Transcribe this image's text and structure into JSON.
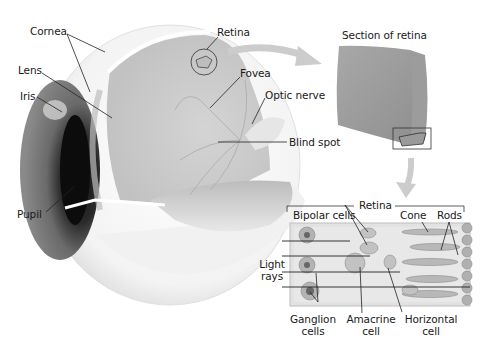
{
  "eye": {
    "labels": {
      "cornea": "Cornea",
      "lens": "Lens",
      "iris": "Iris",
      "pupil": "Pupil",
      "retina": "Retina",
      "fovea": "Fovea",
      "optic_nerve": "Optic nerve",
      "blind_spot": "Blind spot"
    }
  },
  "section": {
    "title": "Section of retina"
  },
  "retina_detail": {
    "title": "Retina",
    "labels": {
      "bipolar": "Bipolar cells",
      "cone": "Cone",
      "rods": "Rods",
      "light_1": "Light",
      "light_2": "rays",
      "ganglion_1": "Ganglion",
      "ganglion_2": "cells",
      "amacrine_1": "Amacrine",
      "amacrine_2": "cell",
      "horizontal_1": "Horizontal",
      "horizontal_2": "cell"
    }
  },
  "colors": {
    "arrow": "#c8c8c8",
    "tissue": "#9a9a9a",
    "detail_bg": "#e4e4e4",
    "iris_dark": "#3a3a3a"
  }
}
